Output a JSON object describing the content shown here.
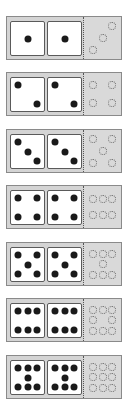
{
  "colors": {
    "card_bg": "#d4d4d4",
    "card_border": "#8a8a8a",
    "die_bg": "#ffffff",
    "die_border": "#5a5a5a",
    "pip": "#1a1a1a",
    "ring": "#666666"
  },
  "cards": [
    {
      "top": 16,
      "pips": 1,
      "rings": 3
    },
    {
      "top": 72,
      "pips": 2,
      "rings": 4
    },
    {
      "top": 129,
      "pips": 3,
      "rings": 5
    },
    {
      "top": 185,
      "pips": 4,
      "rings": 6
    },
    {
      "top": 242,
      "pips": 5,
      "rings": 7
    },
    {
      "top": 298,
      "pips": 6,
      "rings": 8
    },
    {
      "top": 355,
      "pips": 7,
      "rings": 9
    }
  ],
  "pip_layouts": {
    "1": [
      [
        50,
        50
      ]
    ],
    "2": [
      [
        22,
        22
      ],
      [
        78,
        78
      ]
    ],
    "3": [
      [
        22,
        22
      ],
      [
        50,
        50
      ],
      [
        78,
        78
      ]
    ],
    "4": [
      [
        22,
        22
      ],
      [
        78,
        22
      ],
      [
        22,
        78
      ],
      [
        78,
        78
      ]
    ],
    "5": [
      [
        22,
        22
      ],
      [
        78,
        22
      ],
      [
        50,
        50
      ],
      [
        22,
        78
      ],
      [
        78,
        78
      ]
    ],
    "6": [
      [
        20,
        22
      ],
      [
        50,
        22
      ],
      [
        80,
        22
      ],
      [
        20,
        78
      ],
      [
        50,
        78
      ],
      [
        80,
        78
      ]
    ],
    "7": [
      [
        20,
        20
      ],
      [
        50,
        20
      ],
      [
        80,
        20
      ],
      [
        50,
        50
      ],
      [
        20,
        80
      ],
      [
        50,
        80
      ],
      [
        80,
        80
      ]
    ]
  },
  "ring_layouts": {
    "3": [
      [
        75,
        22
      ],
      [
        50,
        50
      ],
      [
        25,
        78
      ]
    ],
    "4": [
      [
        25,
        28
      ],
      [
        75,
        28
      ],
      [
        25,
        72
      ],
      [
        75,
        72
      ]
    ],
    "5": [
      [
        25,
        22
      ],
      [
        75,
        22
      ],
      [
        50,
        50
      ],
      [
        25,
        78
      ],
      [
        75,
        78
      ]
    ],
    "6": [
      [
        25,
        30
      ],
      [
        50,
        30
      ],
      [
        75,
        30
      ],
      [
        25,
        70
      ],
      [
        50,
        70
      ],
      [
        75,
        70
      ]
    ],
    "7": [
      [
        25,
        25
      ],
      [
        50,
        25
      ],
      [
        75,
        25
      ],
      [
        50,
        50
      ],
      [
        25,
        75
      ],
      [
        50,
        75
      ],
      [
        75,
        75
      ]
    ],
    "8": [
      [
        25,
        25
      ],
      [
        50,
        25
      ],
      [
        75,
        25
      ],
      [
        25,
        50
      ],
      [
        75,
        50
      ],
      [
        25,
        75
      ],
      [
        50,
        75
      ],
      [
        75,
        75
      ]
    ],
    "9": [
      [
        25,
        25
      ],
      [
        50,
        25
      ],
      [
        75,
        25
      ],
      [
        25,
        50
      ],
      [
        50,
        50
      ],
      [
        75,
        50
      ],
      [
        25,
        75
      ],
      [
        50,
        75
      ],
      [
        75,
        75
      ]
    ]
  }
}
